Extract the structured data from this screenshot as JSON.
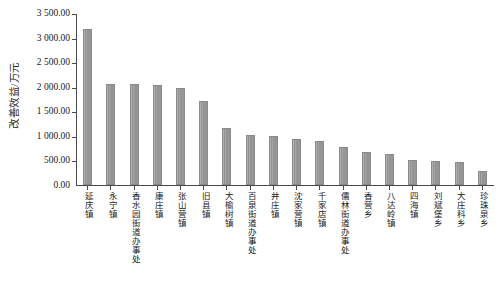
{
  "chart_data": {
    "type": "bar",
    "title": "",
    "subtitle": "",
    "xlabel": "",
    "ylabel": "改善效益/万元",
    "ylim": [
      0,
      3500
    ],
    "ytick_step": 500,
    "ytick_labels": [
      "3 500.00",
      "3 000.00",
      "2 500.00",
      "2 000.00",
      "1 500.00",
      "1 000.00",
      "500.00",
      "0.00"
    ],
    "ytick_values": [
      3500,
      3000,
      2500,
      2000,
      1500,
      1000,
      500,
      0
    ],
    "grid": false,
    "legend": false,
    "legend_position": "none",
    "bar_color": "#9a9a9a",
    "axis_color": "#4a4a4a",
    "categories": [
      "延庆镇",
      "永宁镇",
      "香水园街道办事处",
      "康庄镇",
      "张山营镇",
      "旧县镇",
      "大榆树镇",
      "百泉街道办事处",
      "井庄镇",
      "沈家营镇",
      "千家店镇",
      "儒林街道办事处",
      "香营乡",
      "八达岭镇",
      "四海镇",
      "刘斌堡乡",
      "大庄科乡",
      "珍珠泉乡"
    ],
    "values": [
      3200,
      2060,
      2060,
      2055,
      1980,
      1720,
      1175,
      1020,
      995,
      935,
      895,
      775,
      670,
      640,
      520,
      500,
      470,
      285
    ]
  }
}
